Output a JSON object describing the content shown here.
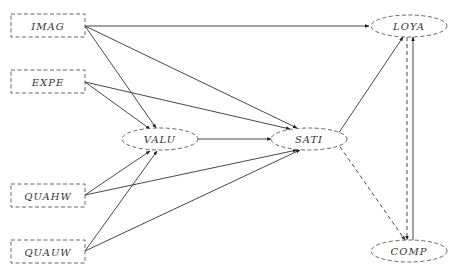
{
  "diagram": {
    "type": "path-model",
    "nodes": [
      {
        "id": "IMAG",
        "label": "IMAG",
        "shape": "rect",
        "style": "dashed"
      },
      {
        "id": "EXPE",
        "label": "EXPE",
        "shape": "rect",
        "style": "dashed"
      },
      {
        "id": "QUAHW",
        "label": "QUAHW",
        "shape": "rect",
        "style": "dashed"
      },
      {
        "id": "QUAUW",
        "label": "QUAUW",
        "shape": "rect",
        "style": "dashed"
      },
      {
        "id": "VALU",
        "label": "VALU",
        "shape": "ellipse",
        "style": "dashed"
      },
      {
        "id": "SATI",
        "label": "SATI",
        "shape": "ellipse",
        "style": "dashed"
      },
      {
        "id": "LOYA",
        "label": "LOYA",
        "shape": "ellipse",
        "style": "dashed"
      },
      {
        "id": "COMP",
        "label": "COMP",
        "shape": "ellipse",
        "style": "dashed"
      }
    ],
    "edges": [
      {
        "from": "IMAG",
        "to": "LOYA",
        "style": "solid"
      },
      {
        "from": "IMAG",
        "to": "SATI",
        "style": "solid"
      },
      {
        "from": "IMAG",
        "to": "VALU",
        "style": "solid"
      },
      {
        "from": "EXPE",
        "to": "SATI",
        "style": "solid"
      },
      {
        "from": "EXPE",
        "to": "VALU",
        "style": "solid"
      },
      {
        "from": "QUAHW",
        "to": "VALU",
        "style": "solid"
      },
      {
        "from": "QUAHW",
        "to": "SATI",
        "style": "solid"
      },
      {
        "from": "QUAUW",
        "to": "VALU",
        "style": "solid"
      },
      {
        "from": "QUAUW",
        "to": "SATI",
        "style": "solid"
      },
      {
        "from": "VALU",
        "to": "SATI",
        "style": "solid"
      },
      {
        "from": "SATI",
        "to": "LOYA",
        "style": "solid"
      },
      {
        "from": "SATI",
        "to": "COMP",
        "style": "dashed"
      },
      {
        "from": "LOYA",
        "to": "COMP",
        "style": "dashed"
      },
      {
        "from": "COMP",
        "to": "LOYA",
        "style": "solid"
      }
    ]
  },
  "labels": {
    "imag": "IMAG",
    "expe": "EXPE",
    "quahw": "QUAHW",
    "quauw": "QUAUW",
    "valu": "VALU",
    "sati": "SATI",
    "loya": "LOYA",
    "comp": "COMP"
  }
}
